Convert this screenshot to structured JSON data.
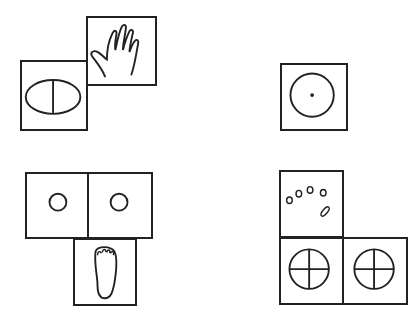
{
  "figure": {
    "groups": [
      {
        "id": "top-left",
        "cards": [
          {
            "symbol": "hand",
            "x": 86,
            "y": 16,
            "w": 71,
            "h": 70
          },
          {
            "symbol": "divided-oval",
            "x": 20,
            "y": 60,
            "w": 68,
            "h": 71
          }
        ]
      },
      {
        "id": "top-right",
        "cards": [
          {
            "symbol": "circle-with-dot",
            "x": 280,
            "y": 63,
            "w": 68,
            "h": 68
          }
        ]
      },
      {
        "id": "bottom-left",
        "cards": [
          {
            "symbol": "small-circle",
            "x": 25,
            "y": 172,
            "w": 64,
            "h": 67
          },
          {
            "symbol": "small-circle",
            "x": 88,
            "y": 172,
            "w": 65,
            "h": 67
          },
          {
            "symbol": "foot",
            "x": 73,
            "y": 238,
            "w": 64,
            "h": 68
          }
        ]
      },
      {
        "id": "bottom-right",
        "cards": [
          {
            "symbol": "dots-arc",
            "x": 279,
            "y": 170,
            "w": 65,
            "h": 68
          },
          {
            "symbol": "quartered-circle",
            "x": 279,
            "y": 237,
            "w": 65,
            "h": 68
          },
          {
            "symbol": "quartered-circle",
            "x": 343,
            "y": 237,
            "w": 65,
            "h": 68
          }
        ]
      }
    ]
  }
}
